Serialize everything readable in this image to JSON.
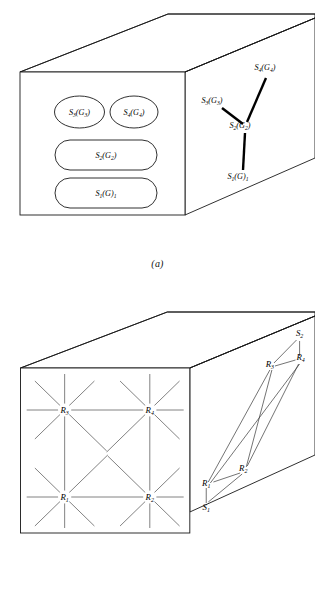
{
  "figure": {
    "panels": [
      {
        "id": "a",
        "caption": "(a)",
        "front_face_items": [
          {
            "name": "ellipse-s3",
            "label_main": "S",
            "label_sub": "3",
            "label_arg": "(G",
            "label_arg_sub": "3",
            "label_close": ")",
            "text": "S3(G3)"
          },
          {
            "name": "ellipse-s4",
            "label_main": "S",
            "label_sub": "4",
            "label_arg": "(G",
            "label_arg_sub": "4",
            "label_close": ")",
            "text": "S4(G4)"
          },
          {
            "name": "capsule-s2",
            "label_main": "S",
            "label_sub": "2",
            "label_arg": "(G",
            "label_arg_sub": "2",
            "label_close": ")",
            "text": "S2(G2)"
          },
          {
            "name": "capsule-s1",
            "label_main": "S",
            "label_sub": "1",
            "label_arg": "(G",
            "label_arg_sub": "",
            "label_close": ")",
            "label_trail": "1",
            "text": "S1(G)1"
          }
        ],
        "tree_nodes": [
          {
            "name": "tree-node-s3",
            "main": "S",
            "sub": "3",
            "arg": "(G",
            "arg_sub": "3",
            "close": ")",
            "x": 212,
            "y": 103
          },
          {
            "name": "tree-node-s4",
            "main": "S",
            "sub": "4",
            "arg": "(G",
            "arg_sub": "4",
            "close": ")",
            "x": 265,
            "y": 70
          },
          {
            "name": "tree-node-s2",
            "main": "S",
            "sub": "2",
            "arg": "(G",
            "arg_sub": "2",
            "close": ")",
            "x": 240,
            "y": 128
          },
          {
            "name": "tree-node-s1",
            "main": "S",
            "sub": "1",
            "arg": "(G",
            "arg_sub": "",
            "close": ")",
            "trail": "1",
            "x": 238,
            "y": 177
          }
        ]
      },
      {
        "id": "b",
        "caption": "(b)",
        "grid_nodes": [
          {
            "name": "grid-node-r3",
            "main": "R",
            "sub": "3",
            "x": 63,
            "y": 410
          },
          {
            "name": "grid-node-r4",
            "main": "R",
            "sub": "4",
            "x": 146,
            "y": 410
          },
          {
            "name": "grid-node-r1",
            "main": "R",
            "sub": "1",
            "x": 63,
            "y": 497
          },
          {
            "name": "grid-node-r2",
            "main": "R",
            "sub": "2",
            "x": 146,
            "y": 497
          }
        ],
        "net_nodes": [
          {
            "name": "net-node-s2",
            "main": "S",
            "sub": "2",
            "x": 294,
            "y": 336
          },
          {
            "name": "net-node-r4",
            "main": "R",
            "sub": "4",
            "x": 295,
            "y": 359
          },
          {
            "name": "net-node-r3",
            "main": "R",
            "sub": "3",
            "x": 265,
            "y": 366
          },
          {
            "name": "net-node-r2",
            "main": "R",
            "sub": "2",
            "x": 238,
            "y": 470
          },
          {
            "name": "net-node-r1",
            "main": "R",
            "sub": "1",
            "x": 201,
            "y": 485
          },
          {
            "name": "net-node-s1",
            "main": "S",
            "sub": "1",
            "x": 201,
            "y": 510
          }
        ]
      }
    ]
  },
  "colors": {
    "ink": "#1a1a1a",
    "grid": "#5a5a5a",
    "edge": "#3a3a3a",
    "background": "#ffffff"
  }
}
